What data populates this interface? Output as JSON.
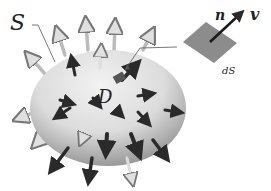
{
  "diagram": {
    "labels": {
      "surface": "S",
      "region": "D",
      "normal": "n",
      "velocity": "v",
      "element": "dS"
    },
    "colors": {
      "surface_light": "#e8e8e8",
      "surface_dark": "#8a8a8a",
      "patch": "#8c8c8c",
      "arrow_dark": "#2a2a2a",
      "arrow_light": "#d8d8d8",
      "leader": "#555555"
    }
  }
}
